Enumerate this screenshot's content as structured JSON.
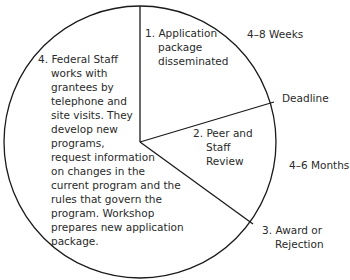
{
  "diagram": {
    "type": "cycle-pie",
    "circle": {
      "cx": 140,
      "cy": 142,
      "r": 136,
      "stroke": "#1a1a1a"
    },
    "dividers": [
      {
        "name": "top",
        "x2": 140,
        "y2": 6
      },
      {
        "name": "deadline",
        "x2": 274,
        "y2": 102
      },
      {
        "name": "award",
        "x2": 253,
        "y2": 224
      }
    ],
    "stages": [
      {
        "number": "1.",
        "lines": [
          "Application",
          "package",
          "disseminated"
        ]
      },
      {
        "number": "2.",
        "lines": [
          "Peer and",
          "Staff",
          "Review"
        ]
      },
      {
        "number": "3.",
        "lines": [
          "Award or",
          "Rejection"
        ]
      },
      {
        "number": "4.",
        "lines": [
          "Federal Staff",
          "works with",
          "grantees by",
          "telephone and",
          "site visits. They",
          "develop new",
          "programs,",
          "request information",
          "on changes in the",
          "current program and the",
          "rules that govern the",
          "program. Workshop",
          "prepares new application",
          "package."
        ]
      }
    ],
    "annotations": {
      "time1": "4–8 Weeks",
      "deadline": "Deadline",
      "time2": "4–6 Months"
    }
  }
}
